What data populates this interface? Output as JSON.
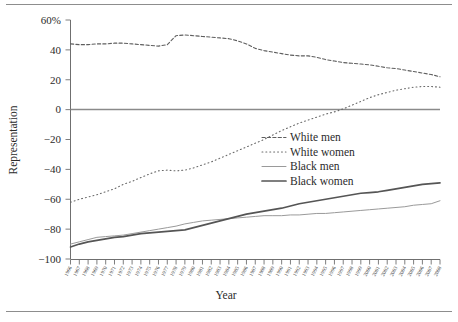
{
  "chart_data": {
    "type": "line",
    "title": "",
    "xlabel": "Year",
    "ylabel": "Representation",
    "ylim": [
      -100,
      60
    ],
    "xlim": [
      1966,
      2008
    ],
    "yticks": [
      60,
      40,
      20,
      0,
      -20,
      -40,
      -60,
      -80,
      -100
    ],
    "ytick_labels": [
      "60%",
      "40",
      "20",
      "0",
      "−20",
      "−40",
      "−60",
      "−80",
      "−100"
    ],
    "grid": false,
    "zero_line": true,
    "legend_position": "center-right",
    "x": [
      1966,
      1967,
      1968,
      1969,
      1970,
      1971,
      1972,
      1973,
      1974,
      1975,
      1976,
      1977,
      1978,
      1979,
      1980,
      1981,
      1982,
      1983,
      1984,
      1985,
      1986,
      1987,
      1988,
      1989,
      1990,
      1991,
      1992,
      1993,
      1994,
      1995,
      1996,
      1997,
      1998,
      1999,
      2000,
      2001,
      2002,
      2003,
      2004,
      2005,
      2006,
      2007,
      2008
    ],
    "xtick_labels": [
      "1966",
      "1967",
      "1968",
      "1969",
      "1970",
      "1971",
      "1972",
      "1973",
      "1974",
      "1975",
      "1976",
      "1977",
      "1978",
      "1979",
      "1980",
      "1981",
      "1982",
      "1983",
      "1984",
      "1985",
      "1986",
      "1987",
      "1988",
      "1989",
      "1990",
      "1991",
      "1992",
      "1993",
      "1994",
      "1995",
      "1996",
      "1997",
      "1998",
      "1999",
      "2000",
      "2001",
      "2002",
      "2003",
      "2004",
      "2005",
      "2006",
      "2007",
      "2008"
    ],
    "series": [
      {
        "name": "White men",
        "style": "dashed",
        "color": "#5e5e5e",
        "values": [
          44,
          43.5,
          43.5,
          44,
          44,
          44.5,
          44.5,
          44,
          43.5,
          43,
          42.5,
          43.5,
          49.5,
          50,
          49.5,
          49,
          48.5,
          48,
          47.5,
          46,
          44,
          41,
          39.5,
          38.5,
          37.5,
          36.5,
          36,
          36,
          35,
          33.5,
          32.5,
          31.5,
          31,
          30.5,
          30,
          29,
          28,
          27.5,
          26.5,
          25.5,
          24.5,
          23.5,
          22
        ]
      },
      {
        "name": "White women",
        "style": "dotted",
        "color": "#6a6a6a",
        "values": [
          -62,
          -60,
          -58.5,
          -57,
          -55,
          -53,
          -50,
          -48,
          -45.5,
          -43,
          -41,
          -40.5,
          -41,
          -40.5,
          -39,
          -37,
          -35,
          -32.5,
          -30,
          -27.5,
          -25,
          -22.5,
          -20,
          -17,
          -14,
          -11.5,
          -9,
          -7,
          -5,
          -3,
          -1.5,
          0.5,
          3,
          5.5,
          8,
          10,
          11.5,
          13,
          14,
          15,
          15.5,
          15.5,
          15
        ]
      },
      {
        "name": "Black men",
        "style": "solid-thin",
        "color": "#9a9a9a",
        "values": [
          -90,
          -88.5,
          -87,
          -85.5,
          -85,
          -84.5,
          -84,
          -83,
          -82,
          -81,
          -80,
          -79,
          -78,
          -76.5,
          -75.5,
          -74.5,
          -74,
          -73.5,
          -73,
          -72.5,
          -72,
          -71.5,
          -71,
          -71,
          -71,
          -70.5,
          -70.5,
          -70,
          -69.5,
          -69.5,
          -69,
          -68.5,
          -68,
          -67.5,
          -67,
          -66.5,
          -66,
          -65.5,
          -65,
          -64,
          -63.5,
          -63,
          -61
        ]
      },
      {
        "name": "Black women",
        "style": "solid-thick",
        "color": "#555555",
        "values": [
          -92,
          -90,
          -88.5,
          -87.5,
          -86.5,
          -85.5,
          -85,
          -84,
          -83,
          -82.5,
          -82,
          -81.5,
          -81,
          -80.5,
          -79,
          -77.5,
          -76,
          -74.5,
          -73,
          -71.5,
          -70,
          -69,
          -68,
          -67,
          -66,
          -64.5,
          -63,
          -62,
          -61,
          -60,
          -59,
          -58,
          -57,
          -56,
          -55.5,
          -55,
          -54,
          -53,
          -52,
          -51,
          -50,
          -49.5,
          -49
        ]
      }
    ]
  },
  "legend": {
    "items": [
      {
        "label": "White men"
      },
      {
        "label": "White women"
      },
      {
        "label": "Black men"
      },
      {
        "label": "Black women"
      }
    ]
  }
}
